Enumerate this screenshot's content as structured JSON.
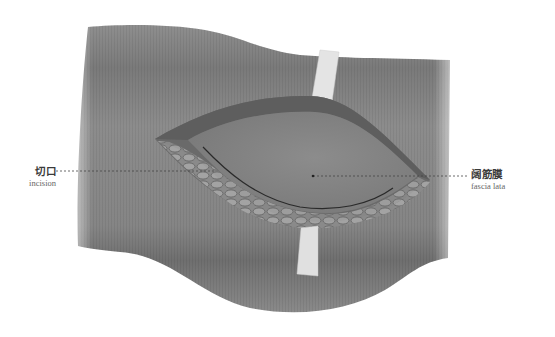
{
  "figure": {
    "colors": {
      "skin": "#8a8a8a",
      "skin_dark": "#6e6e6e",
      "fascia": "#858585",
      "wound_edge": "#555555",
      "retractor_strip": "#e2e2e2",
      "leader_line": "#444444"
    }
  },
  "labels": [
    {
      "id": "incision",
      "zh": "切口",
      "en": "incision"
    },
    {
      "id": "fascia_lata",
      "zh": "阔筋膜",
      "en": "fascia lata"
    }
  ]
}
